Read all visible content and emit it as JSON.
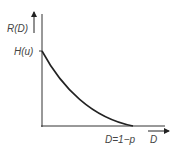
{
  "diagram": {
    "y_axis_label": "R(D)",
    "x_axis_label": "D",
    "y_intercept_label": "H(u)",
    "x_intercept_label": "D=1−p",
    "curve": "convex decreasing curve from (0, H(u)) to (1−p, 0)",
    "colors": {
      "line": "#222222",
      "text": "#444444"
    }
  }
}
